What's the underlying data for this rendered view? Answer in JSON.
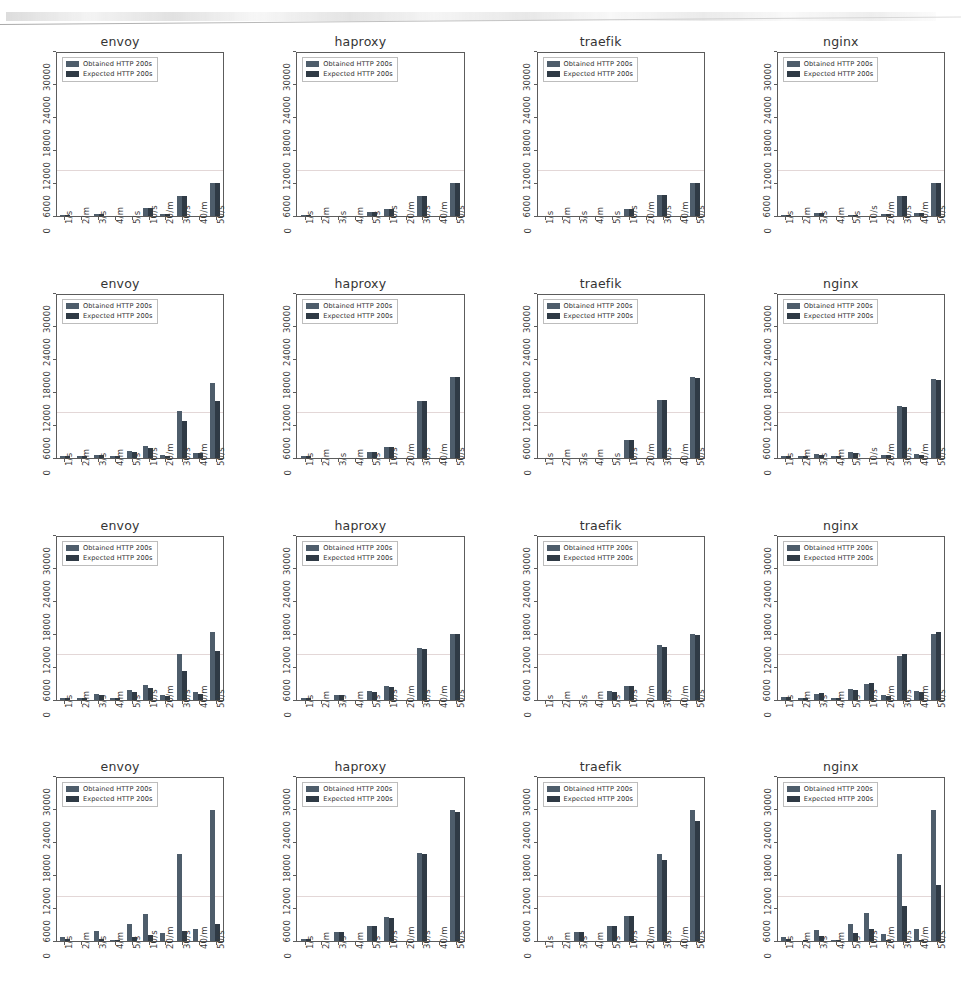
{
  "figure": {
    "rows": 4,
    "columns": 4,
    "proxies": [
      "envoy",
      "haproxy",
      "traefik",
      "nginx"
    ]
  },
  "legend": {
    "obtained_label": "Obtained HTTP 200s",
    "expected_label": "Expected HTTP 200s",
    "obtained_color": "#4e5d6b",
    "expected_color": "#2f3a45"
  },
  "axis": {
    "x_ticks": [
      "1/s",
      "2/m",
      "3/s",
      "4/m",
      "5/s",
      "10/s",
      "20/m",
      "30/s",
      "40/m",
      "50/s"
    ],
    "y_ticks": [
      "0",
      "6000",
      "12000",
      "18000",
      "24000",
      "30000"
    ],
    "ylim": [
      0,
      30000
    ],
    "xlabel": "",
    "ylabel": ""
  },
  "chart_data": [
    {
      "type": "bar",
      "title": "envoy",
      "row": 1,
      "column": 1,
      "categories": [
        "1/s",
        "2/m",
        "3/s",
        "4/m",
        "5/s",
        "10/s",
        "20/m",
        "30/s",
        "40/m",
        "50/s"
      ],
      "series": [
        {
          "name": "Obtained HTTP 200s",
          "values": [
            60,
            0,
            300,
            0,
            0,
            1500,
            400,
            3700,
            0,
            6050
          ]
        },
        {
          "name": "Expected HTTP 200s",
          "values": [
            60,
            0,
            300,
            0,
            0,
            1500,
            400,
            3700,
            0,
            6050
          ]
        }
      ],
      "xlabel": "",
      "ylabel": "",
      "ylim": [
        0,
        30000
      ],
      "grid": false,
      "legend_position": "upper left"
    },
    {
      "type": "bar",
      "title": "haproxy",
      "row": 1,
      "column": 2,
      "categories": [
        "1/s",
        "2/m",
        "3/s",
        "4/m",
        "5/s",
        "10/s",
        "20/m",
        "30/s",
        "40/m",
        "50/s"
      ],
      "series": [
        {
          "name": "Obtained HTTP 200s",
          "values": [
            100,
            0,
            0,
            0,
            700,
            1250,
            0,
            3700,
            0,
            6050
          ]
        },
        {
          "name": "Expected HTTP 200s",
          "values": [
            100,
            0,
            0,
            0,
            700,
            1250,
            0,
            3700,
            0,
            6050
          ]
        }
      ],
      "xlabel": "",
      "ylabel": "",
      "ylim": [
        0,
        30000
      ],
      "grid": false,
      "legend_position": "upper left"
    },
    {
      "type": "bar",
      "title": "traefik",
      "row": 1,
      "column": 3,
      "categories": [
        "1/s",
        "2/m",
        "3/s",
        "4/m",
        "5/s",
        "10/s",
        "20/m",
        "30/s",
        "40/m",
        "50/s"
      ],
      "series": [
        {
          "name": "Obtained HTTP 200s",
          "values": [
            0,
            0,
            0,
            0,
            0,
            1350,
            0,
            3900,
            0,
            6100
          ]
        },
        {
          "name": "Expected HTTP 200s",
          "values": [
            0,
            0,
            0,
            0,
            0,
            1350,
            0,
            3900,
            0,
            6100
          ]
        }
      ],
      "xlabel": "",
      "ylabel": "",
      "ylim": [
        0,
        30000
      ],
      "grid": false,
      "legend_position": "upper left"
    },
    {
      "type": "bar",
      "title": "nginx",
      "row": 1,
      "column": 4,
      "categories": [
        "1/s",
        "2/m",
        "3/s",
        "4/m",
        "5/s",
        "10/s",
        "20/m",
        "30/s",
        "40/m",
        "50/s"
      ],
      "series": [
        {
          "name": "Obtained HTTP 200s",
          "values": [
            150,
            0,
            500,
            0,
            120,
            0,
            400,
            3650,
            600,
            6050
          ]
        },
        {
          "name": "Expected HTTP 200s",
          "values": [
            150,
            0,
            500,
            0,
            120,
            0,
            400,
            3650,
            600,
            6050
          ]
        }
      ],
      "xlabel": "",
      "ylabel": "",
      "ylim": [
        0,
        30000
      ],
      "grid": false,
      "legend_position": "upper left"
    },
    {
      "type": "bar",
      "title": "envoy",
      "row": 2,
      "column": 1,
      "categories": [
        "1/s",
        "2/m",
        "3/s",
        "4/m",
        "5/s",
        "10/s",
        "20/m",
        "30/s",
        "40/m",
        "50/s"
      ],
      "series": [
        {
          "name": "Obtained HTTP 200s",
          "values": [
            300,
            60,
            600,
            150,
            1300,
            2100,
            450,
            8600,
            900,
            13700
          ]
        },
        {
          "name": "Expected HTTP 200s",
          "values": [
            250,
            40,
            450,
            100,
            1150,
            1800,
            350,
            6800,
            800,
            10400
          ]
        }
      ],
      "xlabel": "",
      "ylabel": "",
      "ylim": [
        0,
        30000
      ],
      "grid": false,
      "legend_position": "upper left"
    },
    {
      "type": "bar",
      "title": "haproxy",
      "row": 2,
      "column": 2,
      "categories": [
        "1/s",
        "2/m",
        "3/s",
        "4/m",
        "5/s",
        "10/s",
        "20/m",
        "30/s",
        "40/m",
        "50/s"
      ],
      "series": [
        {
          "name": "Obtained HTTP 200s",
          "values": [
            300,
            0,
            0,
            0,
            1100,
            2000,
            0,
            10400,
            0,
            14900
          ]
        },
        {
          "name": "Expected HTTP 200s",
          "values": [
            300,
            0,
            0,
            0,
            1100,
            2000,
            0,
            10400,
            0,
            14900
          ]
        }
      ],
      "xlabel": "",
      "ylabel": "",
      "ylim": [
        0,
        30000
      ],
      "grid": false,
      "legend_position": "upper left"
    },
    {
      "type": "bar",
      "title": "traefik",
      "row": 2,
      "column": 3,
      "categories": [
        "1/s",
        "2/m",
        "3/s",
        "4/m",
        "5/s",
        "10/s",
        "20/m",
        "30/s",
        "40/m",
        "50/s"
      ],
      "series": [
        {
          "name": "Obtained HTTP 200s",
          "values": [
            0,
            0,
            0,
            0,
            0,
            3200,
            0,
            10600,
            0,
            14900
          ]
        },
        {
          "name": "Expected HTTP 200s",
          "values": [
            0,
            0,
            0,
            0,
            0,
            3200,
            0,
            10600,
            0,
            14600
          ]
        }
      ],
      "xlabel": "",
      "ylabel": "",
      "ylim": [
        0,
        30000
      ],
      "grid": false,
      "legend_position": "upper left"
    },
    {
      "type": "bar",
      "title": "nginx",
      "row": 2,
      "column": 4,
      "categories": [
        "1/s",
        "2/m",
        "3/s",
        "4/m",
        "5/s",
        "10/s",
        "20/m",
        "30/s",
        "40/m",
        "50/s"
      ],
      "series": [
        {
          "name": "Obtained HTTP 200s",
          "values": [
            350,
            100,
            700,
            250,
            1000,
            0,
            600,
            9500,
            700,
            14500
          ]
        },
        {
          "name": "Expected HTTP 200s",
          "values": [
            300,
            80,
            600,
            180,
            900,
            0,
            500,
            9300,
            600,
            14400
          ]
        }
      ],
      "xlabel": "",
      "ylabel": "",
      "ylim": [
        0,
        30000
      ],
      "grid": false,
      "legend_position": "upper left"
    },
    {
      "type": "bar",
      "title": "envoy",
      "row": 3,
      "column": 1,
      "categories": [
        "1/s",
        "2/m",
        "3/s",
        "4/m",
        "5/s",
        "10/s",
        "20/m",
        "30/s",
        "40/m",
        "50/s"
      ],
      "series": [
        {
          "name": "Obtained HTTP 200s",
          "values": [
            350,
            80,
            1100,
            150,
            1700,
            2700,
            900,
            8300,
            1400,
            12400
          ]
        },
        {
          "name": "Expected HTTP 200s",
          "values": [
            300,
            60,
            900,
            120,
            1400,
            2100,
            700,
            5200,
            1100,
            9000
          ]
        }
      ],
      "xlabel": "",
      "ylabel": "",
      "ylim": [
        0,
        30000
      ],
      "grid": false,
      "legend_position": "upper left"
    },
    {
      "type": "bar",
      "title": "haproxy",
      "row": 3,
      "column": 2,
      "categories": [
        "1/s",
        "2/m",
        "3/s",
        "4/m",
        "5/s",
        "10/s",
        "20/m",
        "30/s",
        "40/m",
        "50/s"
      ],
      "series": [
        {
          "name": "Obtained HTTP 200s",
          "values": [
            300,
            0,
            800,
            0,
            1500,
            2400,
            0,
            9500,
            0,
            12100
          ]
        },
        {
          "name": "Expected HTTP 200s",
          "values": [
            280,
            0,
            750,
            0,
            1400,
            2350,
            0,
            9300,
            0,
            12000
          ]
        }
      ],
      "xlabel": "",
      "ylabel": "",
      "ylim": [
        0,
        30000
      ],
      "grid": false,
      "legend_position": "upper left"
    },
    {
      "type": "bar",
      "title": "traefik",
      "row": 3,
      "column": 3,
      "categories": [
        "1/s",
        "2/m",
        "3/s",
        "4/m",
        "5/s",
        "10/s",
        "20/m",
        "30/s",
        "40/m",
        "50/s"
      ],
      "series": [
        {
          "name": "Obtained HTTP 200s",
          "values": [
            0,
            0,
            0,
            0,
            1500,
            2500,
            0,
            10000,
            0,
            12100
          ]
        },
        {
          "name": "Expected HTTP 200s",
          "values": [
            0,
            0,
            0,
            0,
            1400,
            2450,
            0,
            9700,
            0,
            11900
          ]
        }
      ],
      "xlabel": "",
      "ylabel": "",
      "ylim": [
        0,
        30000
      ],
      "grid": false,
      "legend_position": "upper left"
    },
    {
      "type": "bar",
      "title": "nginx",
      "row": 3,
      "column": 4,
      "categories": [
        "1/s",
        "2/m",
        "3/s",
        "4/m",
        "5/s",
        "10/s",
        "20/m",
        "30/s",
        "40/m",
        "50/s"
      ],
      "series": [
        {
          "name": "Obtained HTTP 200s",
          "values": [
            400,
            120,
            1100,
            150,
            1900,
            2900,
            800,
            8000,
            1500,
            12000
          ]
        },
        {
          "name": "Expected HTTP 200s",
          "values": [
            380,
            100,
            1200,
            130,
            1800,
            3100,
            700,
            8300,
            1300,
            12500
          ]
        }
      ],
      "xlabel": "",
      "ylabel": "",
      "ylim": [
        0,
        30000
      ],
      "grid": false,
      "legend_position": "upper left"
    },
    {
      "type": "bar",
      "title": "envoy",
      "row": 4,
      "column": 1,
      "categories": [
        "1/s",
        "2/m",
        "3/s",
        "4/m",
        "5/s",
        "10/s",
        "20/m",
        "30/s",
        "40/m",
        "50/s"
      ],
      "series": [
        {
          "name": "Obtained HTTP 200s",
          "values": [
            700,
            0,
            1900,
            150,
            3100,
            5100,
            1500,
            16000,
            2200,
            24100
          ]
        },
        {
          "name": "Expected HTTP 200s",
          "values": [
            350,
            0,
            500,
            80,
            700,
            1200,
            0,
            1900,
            0,
            3100
          ]
        }
      ],
      "xlabel": "",
      "ylabel": "",
      "ylim": [
        0,
        30000
      ],
      "grid": false,
      "legend_position": "upper left"
    },
    {
      "type": "bar",
      "title": "haproxy",
      "row": 4,
      "column": 2,
      "categories": [
        "1/s",
        "2/m",
        "3/s",
        "4/m",
        "5/s",
        "10/s",
        "20/m",
        "30/s",
        "40/m",
        "50/s"
      ],
      "series": [
        {
          "name": "Obtained HTTP 200s",
          "values": [
            500,
            0,
            1700,
            0,
            2900,
            4400,
            0,
            16200,
            0,
            24100
          ]
        },
        {
          "name": "Expected HTTP 200s",
          "values": [
            480,
            0,
            1650,
            0,
            2850,
            4350,
            0,
            16000,
            0,
            23800
          ]
        }
      ],
      "xlabel": "",
      "ylabel": "",
      "ylim": [
        0,
        30000
      ],
      "grid": false,
      "legend_position": "upper left"
    },
    {
      "type": "bar",
      "title": "traefik",
      "row": 4,
      "column": 3,
      "categories": [
        "1/s",
        "2/m",
        "3/s",
        "4/m",
        "5/s",
        "10/s",
        "20/m",
        "30/s",
        "40/m",
        "50/s"
      ],
      "series": [
        {
          "name": "Obtained HTTP 200s",
          "values": [
            0,
            0,
            1700,
            0,
            2900,
            4700,
            0,
            16100,
            0,
            24100
          ]
        },
        {
          "name": "Expected HTTP 200s",
          "values": [
            0,
            0,
            1650,
            0,
            2850,
            4600,
            0,
            15000,
            0,
            22200
          ]
        }
      ],
      "xlabel": "",
      "ylabel": "",
      "ylim": [
        0,
        30000
      ],
      "grid": false,
      "legend_position": "upper left"
    },
    {
      "type": "bar",
      "title": "nginx",
      "row": 4,
      "column": 4,
      "categories": [
        "1/s",
        "2/m",
        "3/s",
        "4/m",
        "5/s",
        "10/s",
        "20/m",
        "30/s",
        "40/m",
        "50/s"
      ],
      "series": [
        {
          "name": "Obtained HTTP 200s",
          "values": [
            700,
            0,
            2000,
            200,
            3100,
            5200,
            1400,
            16000,
            2200,
            24100
          ]
        },
        {
          "name": "Expected HTTP 200s",
          "values": [
            400,
            100,
            900,
            150,
            1500,
            2200,
            200,
            6400,
            300,
            10400
          ]
        }
      ],
      "xlabel": "",
      "ylabel": "",
      "ylim": [
        0,
        30000
      ],
      "grid": false,
      "legend_position": "upper left"
    }
  ]
}
